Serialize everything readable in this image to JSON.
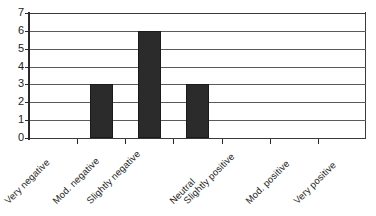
{
  "chart_data": {
    "type": "bar",
    "title": "",
    "subtitle": "",
    "xlabel": "",
    "ylabel": "",
    "categories": [
      "Very negative",
      "Mod. negative",
      "Slightly negative",
      "Neutral",
      "Slightly positive",
      "Mod. positive",
      "Very positive"
    ],
    "values": [
      0,
      3,
      6,
      3,
      0,
      0,
      0
    ],
    "ylim": [
      0,
      7
    ],
    "yticks": [
      0,
      1,
      2,
      3,
      4,
      5,
      6,
      7
    ],
    "ytick_labels": [
      "0",
      "1",
      "2",
      "3",
      "4",
      "5",
      "6",
      "7"
    ],
    "grid": true,
    "grid_axis": "y",
    "legend": false,
    "legend_position": "none",
    "bar_color": "#2b2b2b",
    "grid_color": "#5a5a5a",
    "axis_color": "#2b2b2b",
    "background_color": "#ffffff",
    "xtick_label_rotation": 45
  }
}
